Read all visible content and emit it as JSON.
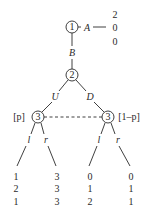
{
  "diagram": {
    "type": "extensive-form game tree",
    "colors": {
      "ink": "#2a2a2a",
      "background": "#ffffff"
    },
    "nodes": [
      {
        "id": "n1",
        "player": "1",
        "x": 72,
        "y": 27
      },
      {
        "id": "n2",
        "player": "2",
        "x": 72,
        "y": 75
      },
      {
        "id": "n3L",
        "player": "3",
        "x": 38,
        "y": 117,
        "belief": "[p]"
      },
      {
        "id": "n3R",
        "player": "3",
        "x": 108,
        "y": 117,
        "belief": "[1–p]"
      }
    ],
    "actions": {
      "A": "A",
      "B": "B",
      "U": "U",
      "D": "D",
      "l_left": "l",
      "r_left": "r",
      "l_right": "l",
      "r_right": "r"
    },
    "information_set": {
      "connects": [
        "n3L",
        "n3R"
      ],
      "style": "dashed"
    },
    "payoffs": {
      "A": [
        "2",
        "0",
        "0"
      ],
      "Ul": [
        "1",
        "2",
        "1"
      ],
      "Ur": [
        "3",
        "3",
        "3"
      ],
      "Dl": [
        "0",
        "1",
        "2"
      ],
      "Dr": [
        "0",
        "1",
        "1"
      ]
    }
  }
}
